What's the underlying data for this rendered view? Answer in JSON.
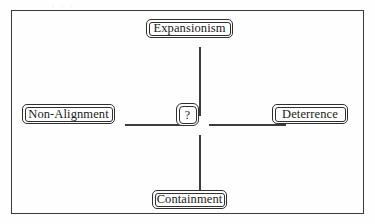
{
  "figure": {
    "type": "concept-diagram",
    "layout": "cross",
    "page_top_remnant": ". . .",
    "center": {
      "label": "?",
      "name": "unknown-strategy"
    },
    "nodes": [
      {
        "id": "expansionism",
        "label": "Expansionism",
        "position": "top"
      },
      {
        "id": "non-alignment",
        "label": "Non-Alignment",
        "position": "left"
      },
      {
        "id": "deterrence",
        "label": "Deterrence",
        "position": "right"
      },
      {
        "id": "containment",
        "label": "Containment",
        "position": "bottom"
      }
    ],
    "connectors": [
      {
        "from": "expansionism",
        "to": "center",
        "orientation": "vertical"
      },
      {
        "from": "non-alignment",
        "to": "center",
        "orientation": "horizontal"
      },
      {
        "from": "deterrence",
        "to": "center",
        "orientation": "horizontal"
      },
      {
        "from": "containment",
        "to": "center",
        "orientation": "vertical"
      }
    ],
    "colors": {
      "frame": "#3a3a3a",
      "box_border": "#2f2f2f",
      "connector": "#3c3c3c",
      "text": "#1a1a1a",
      "background": "#fefefe"
    }
  }
}
